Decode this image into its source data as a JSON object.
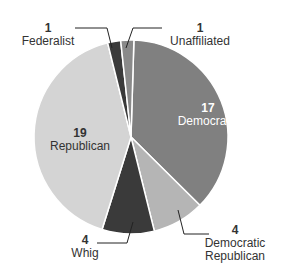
{
  "chart_data": {
    "type": "pie",
    "title": "",
    "slices": [
      {
        "label": "Democratic",
        "value": 17,
        "color": "#808080"
      },
      {
        "label": "Democratic Republican",
        "value": 4,
        "color": "#b5b5b5"
      },
      {
        "label": "Whig",
        "value": 4,
        "color": "#3a3a3a"
      },
      {
        "label": "Republican",
        "value": 19,
        "color": "#d4d4d4"
      },
      {
        "label": "Federalist",
        "value": 1,
        "color": "#3a3a3a"
      },
      {
        "label": "Unaffiliated",
        "value": 1,
        "color": "#8a8a8a"
      }
    ]
  },
  "labels": {
    "democratic": {
      "num": "17",
      "name": "Democratic"
    },
    "demrep": {
      "num": "4",
      "name1": "Democratic",
      "name2": "Republican"
    },
    "whig": {
      "num": "4",
      "name": "Whig"
    },
    "republican": {
      "num": "19",
      "name": "Republican"
    },
    "federalist": {
      "num": "1",
      "name": "Federalist"
    },
    "unaffiliated": {
      "num": "1",
      "name": "Unaffiliated"
    }
  }
}
